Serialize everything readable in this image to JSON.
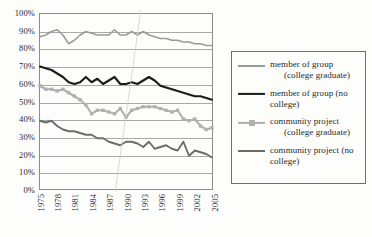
{
  "chart_data": {
    "type": "line",
    "title": "",
    "xlabel": "",
    "ylabel": "",
    "xlim": [
      1975,
      2005
    ],
    "ylim": [
      0,
      100
    ],
    "grid": true,
    "legend_position": "right",
    "y_ticks": [
      "100%",
      "90%",
      "80%",
      "70%",
      "60%",
      "50%",
      "40%",
      "30%",
      "20%",
      "10%",
      "0%"
    ],
    "y_tick_values": [
      100,
      90,
      80,
      70,
      60,
      50,
      40,
      30,
      20,
      10,
      0
    ],
    "x_ticks": [
      "1975",
      "1978",
      "1981",
      "1984",
      "1987",
      "1990",
      "1993",
      "1996",
      "1999",
      "2002",
      "2005"
    ],
    "x_tick_values": [
      1975,
      1978,
      1981,
      1984,
      1987,
      1990,
      1993,
      1996,
      1999,
      2002,
      2005
    ],
    "x": [
      1975,
      1976,
      1977,
      1978,
      1979,
      1980,
      1981,
      1982,
      1983,
      1984,
      1985,
      1986,
      1987,
      1988,
      1989,
      1990,
      1991,
      1992,
      1993,
      1994,
      1995,
      1996,
      1997,
      1998,
      1999,
      2000,
      2001,
      2002,
      2003,
      2004,
      2005
    ],
    "series": [
      {
        "name": "member of group (college graduate)",
        "color": "#9a9a9a",
        "marker": "none",
        "width": 1.6,
        "values": [
          87,
          88,
          90,
          91,
          88,
          83,
          85,
          88,
          90,
          89,
          88,
          88,
          88,
          91,
          88,
          88,
          90,
          88,
          90,
          88,
          87,
          86,
          86,
          85,
          85,
          84,
          84,
          83,
          83,
          82,
          82
        ]
      },
      {
        "name": "member of group (no college)",
        "color": "#1c1c1c",
        "marker": "none",
        "width": 2.2,
        "values": [
          70,
          69,
          68,
          66,
          64,
          61,
          60,
          61,
          64,
          61,
          63,
          60,
          62,
          64,
          60,
          60,
          61,
          60,
          62,
          64,
          62,
          59,
          58,
          57,
          56,
          55,
          54,
          53,
          53,
          52,
          51
        ]
      },
      {
        "name": "community project (college graduate)",
        "color": "#b0b0b0",
        "marker": "square",
        "width": 2.2,
        "values": [
          59,
          57,
          57,
          56,
          57,
          55,
          53,
          51,
          48,
          43,
          45,
          45,
          44,
          43,
          46,
          41,
          45,
          46,
          47,
          47,
          47,
          46,
          45,
          44,
          45,
          40,
          39,
          40,
          36,
          34,
          35
        ]
      },
      {
        "name": "community project (no college)",
        "color": "#6b6b6b",
        "marker": "none",
        "width": 1.9,
        "values": [
          39,
          38,
          39,
          36,
          34,
          33,
          33,
          32,
          31,
          31,
          29,
          29,
          27,
          26,
          25,
          27,
          27,
          26,
          24,
          27,
          23,
          24,
          25,
          23,
          22,
          27,
          19,
          22,
          21,
          20,
          18
        ]
      }
    ]
  },
  "legend": {
    "items": [
      {
        "line1": "member of group",
        "line2": "(college graduate)",
        "indent": true,
        "icon": "legend-line-swatch"
      },
      {
        "line1": "member of group (no",
        "line2": "college)",
        "indent": false,
        "icon": "legend-line-swatch"
      },
      {
        "line1": "community project",
        "line2": "(college graduate)",
        "indent": true,
        "icon": "legend-line-marker-swatch"
      },
      {
        "line1": "community project (no",
        "line2": "college)",
        "indent": false,
        "icon": "legend-line-swatch"
      }
    ]
  },
  "colors": {
    "series1": "#9a9a9a",
    "series2": "#1c1c1c",
    "series3": "#b0b0b0",
    "series4": "#6b6b6b",
    "gridline": "#a9a9a9",
    "axis": "#8d8d8d",
    "legend_border": "#6f6f6f",
    "background": "#fdfdfc"
  }
}
